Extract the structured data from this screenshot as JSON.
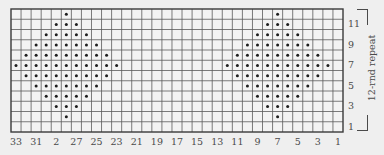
{
  "chart": {
    "title": "",
    "columns": 33,
    "rows": 12,
    "grid_left": 11,
    "grid_top": 9,
    "grid_right": 343,
    "grid_bottom": 132,
    "colors": {
      "background": "#efefef",
      "cell": "#f3f3f3",
      "grid_line": "#5a5a5a",
      "border": "#3a3a3a",
      "dot": "#1e1e1e",
      "label": "#4a4a4a"
    },
    "column_labels": [
      {
        "text": "33",
        "col": 33
      },
      {
        "text": "31",
        "col": 31
      },
      {
        "text": "2",
        "col": 29
      },
      {
        "text": "27",
        "col": 27
      },
      {
        "text": "25",
        "col": 25
      },
      {
        "text": "23",
        "col": 23
      },
      {
        "text": "21",
        "col": 21
      },
      {
        "text": "19",
        "col": 19
      },
      {
        "text": "17",
        "col": 17
      },
      {
        "text": "15",
        "col": 15
      },
      {
        "text": "13",
        "col": 13
      },
      {
        "text": "11",
        "col": 11
      },
      {
        "text": "9",
        "col": 9
      },
      {
        "text": "7",
        "col": 7
      },
      {
        "text": "5",
        "col": 5
      },
      {
        "text": "3",
        "col": 3
      },
      {
        "text": "1",
        "col": 1
      }
    ],
    "row_labels": [
      {
        "text": "11",
        "row": 11
      },
      {
        "text": "9",
        "row": 9
      },
      {
        "text": "7",
        "row": 7
      },
      {
        "text": "5",
        "row": 5
      },
      {
        "text": "3",
        "row": 3
      },
      {
        "text": "1",
        "row": 1
      }
    ],
    "repeat_label": "12-rnd repeat",
    "legend": {
      "dot_symbol": "•"
    },
    "dots_by_row": [
      {
        "row": 12,
        "cols": [
          28,
          7
        ]
      },
      {
        "row": 11,
        "cols": [
          29,
          28,
          27,
          8,
          7,
          6
        ]
      },
      {
        "row": 10,
        "cols": [
          30,
          29,
          28,
          27,
          26,
          9,
          8,
          7,
          6,
          5
        ]
      },
      {
        "row": 9,
        "cols": [
          31,
          30,
          29,
          28,
          27,
          26,
          25,
          10,
          9,
          8,
          7,
          6,
          5,
          4
        ]
      },
      {
        "row": 8,
        "cols": [
          32,
          31,
          30,
          29,
          28,
          27,
          26,
          25,
          24,
          11,
          10,
          9,
          8,
          7,
          6,
          5,
          4,
          3
        ]
      },
      {
        "row": 7,
        "cols": [
          33,
          32,
          31,
          30,
          29,
          28,
          27,
          26,
          25,
          24,
          23,
          12,
          11,
          10,
          9,
          8,
          7,
          6,
          5,
          4,
          3,
          2
        ]
      },
      {
        "row": 6,
        "cols": [
          32,
          31,
          30,
          29,
          28,
          27,
          26,
          25,
          24,
          11,
          10,
          9,
          8,
          7,
          6,
          5,
          4,
          3
        ]
      },
      {
        "row": 5,
        "cols": [
          31,
          30,
          29,
          28,
          27,
          26,
          25,
          10,
          9,
          8,
          7,
          6,
          5,
          4
        ]
      },
      {
        "row": 4,
        "cols": [
          30,
          29,
          28,
          27,
          26,
          9,
          8,
          7,
          6,
          5
        ]
      },
      {
        "row": 3,
        "cols": [
          29,
          28,
          27,
          8,
          7,
          6
        ]
      },
      {
        "row": 2,
        "cols": [
          28,
          7
        ]
      },
      {
        "row": 1,
        "cols": []
      }
    ]
  }
}
